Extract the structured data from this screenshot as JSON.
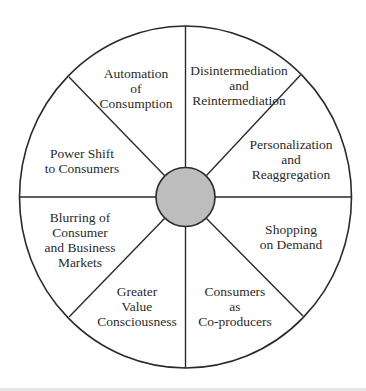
{
  "diagram": {
    "type": "segmented-wheel",
    "center": {
      "label": "",
      "fill": "#bdbdbd"
    },
    "stroke_color": "#2a2a2a",
    "segments": [
      {
        "id": "disintermediation",
        "lines": [
          "Disintermediation",
          "and",
          "Reintermediation"
        ]
      },
      {
        "id": "personalization",
        "lines": [
          "Personalization",
          "and",
          "Reaggregation"
        ]
      },
      {
        "id": "shopping-on-demand",
        "lines": [
          "Shopping",
          "on Demand"
        ]
      },
      {
        "id": "consumers-co-producers",
        "lines": [
          "Consumers",
          "as",
          "Co-producers"
        ]
      },
      {
        "id": "greater-value",
        "lines": [
          "Greater",
          "Value",
          "Consciousness"
        ]
      },
      {
        "id": "blurring-markets",
        "lines": [
          "Blurring of",
          "Consumer",
          "and Business",
          "Markets"
        ]
      },
      {
        "id": "power-shift",
        "lines": [
          "Power Shift",
          "to Consumers"
        ]
      },
      {
        "id": "automation",
        "lines": [
          "Automation",
          "of",
          "Consumption"
        ]
      }
    ]
  }
}
